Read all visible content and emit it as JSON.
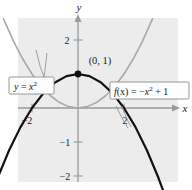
{
  "figure": {
    "name": "parabola-comparison-figure",
    "background_color": "#ffffff",
    "plot_area_color": "#ececec",
    "axis_color": "#9a9a9a",
    "curve_gray_color": "#a8a8a8",
    "curve_black_color": "#111111",
    "label_box_fill": "#fdfdfd",
    "label_box_border": "#8c8c8c"
  },
  "axes": {
    "x_axis_label": "x",
    "y_axis_label": "y",
    "origin_label": "",
    "x_ticks": [
      {
        "value": -2,
        "label": "−2"
      },
      {
        "value": 2,
        "label": "2"
      }
    ],
    "y_ticks": [
      {
        "value": 2,
        "label": "2"
      },
      {
        "value": -1,
        "label": "−1"
      },
      {
        "value": -2,
        "label": "−2"
      }
    ],
    "x_range": [
      -2.6,
      2.2
    ],
    "y_range": [
      -2.6,
      2.4
    ]
  },
  "annotations": {
    "vertex_point_label": "(0, 1)",
    "vertex_point_x": 0,
    "vertex_point_y": 1
  },
  "label_boxes": [
    {
      "id": "left-label-box",
      "name": "label-box-y-equals-x-squared",
      "text_parts": {
        "lhs": "y",
        "eq": " = ",
        "base": "x",
        "exponent": "2"
      },
      "plain_text": "y = x²"
    },
    {
      "id": "right-label-box",
      "name": "label-box-f-of-x",
      "text_parts": {
        "fn": "f",
        "arg": "(x)",
        "eq": " = −",
        "base": "x",
        "exponent": "2",
        "tail": " + 1"
      },
      "plain_text": "f(x) = −x² + 1"
    }
  ],
  "chart_data": {
    "type": "line",
    "title": "",
    "xlabel": "x",
    "ylabel": "y",
    "xlim": [
      -2.6,
      2.2
    ],
    "ylim": [
      -2.6,
      2.4
    ],
    "grid": false,
    "legend": "inline-callout-boxes",
    "series": [
      {
        "name": "y = x^2",
        "equation": "y = x^2",
        "color": "#a8a8a8",
        "style": "solid",
        "width": 1.6,
        "x": [
          -1.62,
          -1.4,
          -1.2,
          -1.0,
          -0.8,
          -0.6,
          -0.4,
          -0.2,
          0,
          0.2,
          0.4,
          0.6,
          0.8,
          1.0,
          1.2,
          1.4,
          1.62
        ],
        "y": [
          2.62,
          1.96,
          1.44,
          1.0,
          0.64,
          0.36,
          0.16,
          0.04,
          0,
          0.04,
          0.16,
          0.36,
          0.64,
          1.0,
          1.44,
          1.96,
          2.62
        ]
      },
      {
        "name": "f(x) = -x^2 + 1",
        "equation": "f(x) = -x^2 + 1",
        "color": "#111111",
        "style": "solid",
        "width": 2.2,
        "x": [
          -1.9,
          -1.75,
          -1.5,
          -1.25,
          -1.0,
          -0.75,
          -0.5,
          -0.25,
          0,
          0.25,
          0.5,
          0.75,
          1.0,
          1.25,
          1.5,
          1.75,
          1.9
        ],
        "y": [
          -2.61,
          -2.06,
          -1.25,
          -0.5625,
          0,
          0.4375,
          0.75,
          0.9375,
          1.0,
          0.9375,
          0.75,
          0.4375,
          0,
          -0.5625,
          -1.25,
          -2.06,
          -2.61
        ]
      }
    ],
    "points": [
      {
        "label": "(0, 1)",
        "x": 0,
        "y": 1,
        "marker": "filled-circle",
        "color": "#111111"
      }
    ]
  }
}
